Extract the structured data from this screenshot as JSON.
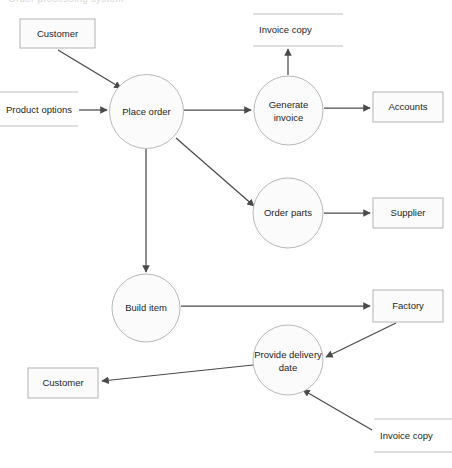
{
  "diagram": {
    "title_clipped": "Order processing system",
    "type": "data-flow-diagram",
    "background_color": "#ffffff",
    "node_fill_color": "#fbfbfb",
    "node_stroke_color": "#b3b3b3",
    "flow_color": "#4a4a4a",
    "store_line_color": "#c0c0c0",
    "processes": [
      {
        "id": "place-order",
        "label": "Place order",
        "cx": 146.5,
        "cy": 111.5,
        "r": 37
      },
      {
        "id": "generate-invoice",
        "label_line1": "Generate",
        "label_line2": "invoice",
        "cx": 288.5,
        "cy": 110.5,
        "r": 34.5
      },
      {
        "id": "order-parts",
        "label": "Order parts",
        "cx": 288,
        "cy": 213,
        "r": 35
      },
      {
        "id": "build-item",
        "label": "Build item",
        "cx": 146,
        "cy": 308,
        "r": 34
      },
      {
        "id": "provide-delivery-date",
        "label_line1": "Provide delivery",
        "label_line2": "date",
        "cx": 288,
        "cy": 360,
        "r": 35
      }
    ],
    "externals": [
      {
        "id": "customer-top",
        "label": "Customer",
        "x": 20,
        "y": 19,
        "w": 75,
        "h": 29
      },
      {
        "id": "accounts",
        "label": "Accounts",
        "x": 373,
        "y": 92,
        "w": 70,
        "h": 30
      },
      {
        "id": "supplier",
        "label": "Supplier",
        "x": 373,
        "y": 198,
        "w": 70,
        "h": 30
      },
      {
        "id": "factory",
        "label": "Factory",
        "x": 373,
        "y": 290,
        "w": 70,
        "h": 32
      },
      {
        "id": "customer-bottom",
        "label": "Customer",
        "x": 28,
        "y": 368,
        "w": 70,
        "h": 30
      }
    ],
    "datastores": [
      {
        "id": "product-options",
        "label": "Product options",
        "x": 0,
        "y": 92,
        "w": 78,
        "h": 34,
        "text_x": 6,
        "text_y": 110
      },
      {
        "id": "invoice-copy-top",
        "label": "Invoice copy",
        "x": 253,
        "y": 14,
        "w": 90,
        "h": 32,
        "text_x": 259,
        "text_y": 30
      },
      {
        "id": "invoice-copy-bottom",
        "label": "Invoice copy",
        "x": 374,
        "y": 419,
        "w": 78,
        "h": 33,
        "text_x": 380,
        "text_y": 436
      }
    ],
    "flows": [
      {
        "id": "customer-to-place-order",
        "from": "customer-top",
        "to": "place-order"
      },
      {
        "id": "product-options-to-place-order",
        "from": "product-options",
        "to": "place-order"
      },
      {
        "id": "place-order-to-generate-invoice",
        "from": "place-order",
        "to": "generate-invoice"
      },
      {
        "id": "place-order-to-order-parts",
        "from": "place-order",
        "to": "order-parts"
      },
      {
        "id": "place-order-to-build-item",
        "from": "place-order",
        "to": "build-item"
      },
      {
        "id": "generate-invoice-to-invoice-copy",
        "from": "generate-invoice",
        "to": "invoice-copy-top"
      },
      {
        "id": "generate-invoice-to-accounts",
        "from": "generate-invoice",
        "to": "accounts"
      },
      {
        "id": "order-parts-to-supplier",
        "from": "order-parts",
        "to": "supplier"
      },
      {
        "id": "build-item-to-factory",
        "from": "build-item",
        "to": "factory"
      },
      {
        "id": "factory-to-provide-delivery-date",
        "from": "factory",
        "to": "provide-delivery-date"
      },
      {
        "id": "invoice-copy-to-provide-delivery-date",
        "from": "invoice-copy-bottom",
        "to": "provide-delivery-date"
      },
      {
        "id": "provide-delivery-date-to-customer",
        "from": "provide-delivery-date",
        "to": "customer-bottom"
      }
    ]
  }
}
